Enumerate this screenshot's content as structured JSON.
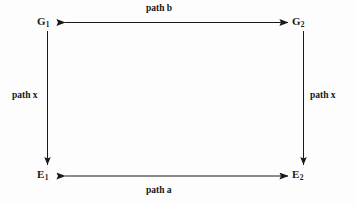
{
  "diagram": {
    "background_color": "#fdfdfd",
    "stroke_color": "#1a1a1a",
    "nodes": [
      {
        "id": "G1",
        "base": "G",
        "subscript": "1",
        "position": "top-left"
      },
      {
        "id": "G2",
        "base": "G",
        "subscript": "2",
        "position": "top-right"
      },
      {
        "id": "E1",
        "base": "E",
        "subscript": "1",
        "position": "bottom-left"
      },
      {
        "id": "E2",
        "base": "E",
        "subscript": "2",
        "position": "bottom-right"
      }
    ],
    "edges": [
      {
        "id": "top-edge",
        "label": "path b",
        "from": "G1",
        "to": "G2",
        "orientation": "horizontal",
        "arrowheads": "both"
      },
      {
        "id": "bottom-edge",
        "label": "path a",
        "from": "E1",
        "to": "E2",
        "orientation": "horizontal",
        "arrowheads": "both"
      },
      {
        "id": "left-edge",
        "label": "path x",
        "from": "G1",
        "to": "E1",
        "orientation": "vertical",
        "arrowheads": "end"
      },
      {
        "id": "right-edge",
        "label": "path x",
        "from": "G2",
        "to": "E2",
        "orientation": "vertical",
        "arrowheads": "end"
      }
    ]
  }
}
